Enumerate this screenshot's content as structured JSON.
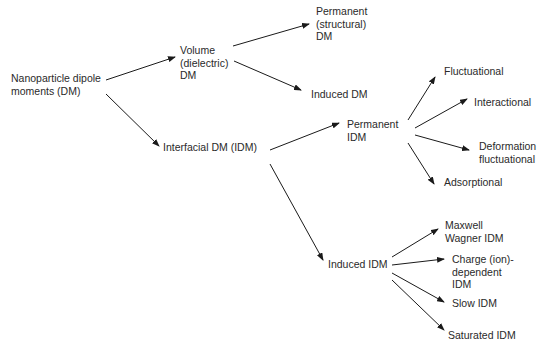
{
  "diagram": {
    "type": "tree",
    "nodes": {
      "root": "Nanoparticle dipole\nmoments (DM)",
      "volume": "Volume\n(dielectric)\nDM",
      "permanent_structural": "Permanent\n(structural)\nDM",
      "induced_dm": "Induced DM",
      "interfacial": "Interfacial DM (IDM)",
      "permanent_idm": "Permanent\nIDM",
      "induced_idm": "Induced IDM",
      "fluctuational": "Fluctuational",
      "interactional": "Interactional",
      "deformation_fluctuational": "Deformation\nfluctuational",
      "adsorptional": "Adsorptional",
      "maxwell_wagner": "Maxwell\nWagner IDM",
      "charge_dependent": "Charge (ion)-\ndependent\nIDM",
      "slow_idm": "Slow IDM",
      "saturated_idm": "Saturated IDM"
    },
    "edges": [
      [
        "root",
        "volume"
      ],
      [
        "root",
        "interfacial"
      ],
      [
        "volume",
        "permanent_structural"
      ],
      [
        "volume",
        "induced_dm"
      ],
      [
        "interfacial",
        "permanent_idm"
      ],
      [
        "interfacial",
        "induced_idm"
      ],
      [
        "permanent_idm",
        "fluctuational"
      ],
      [
        "permanent_idm",
        "interactional"
      ],
      [
        "permanent_idm",
        "deformation_fluctuational"
      ],
      [
        "permanent_idm",
        "adsorptional"
      ],
      [
        "induced_idm",
        "maxwell_wagner"
      ],
      [
        "induced_idm",
        "charge_dependent"
      ],
      [
        "induced_idm",
        "slow_idm"
      ],
      [
        "induced_idm",
        "saturated_idm"
      ]
    ],
    "colors": {
      "line": "#1a1a1a",
      "text": "#2a2a2a",
      "background": "#ffffff"
    }
  }
}
